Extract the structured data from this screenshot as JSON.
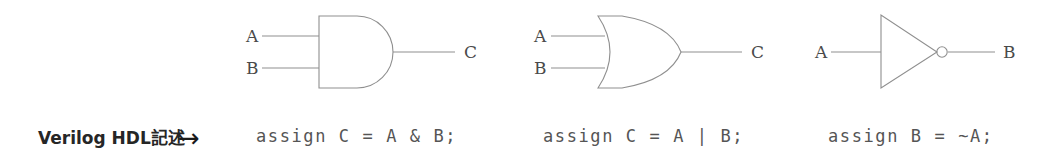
{
  "figure": {
    "background_color": "#ffffff",
    "stroke_color": "#8a8a8a",
    "text_color": "#4a4a4a",
    "caption_color": "#262626"
  },
  "hdl_caption": {
    "label": "Verilog HDL記述",
    "arrow": "→",
    "arrow_name": "right-arrow-icon"
  },
  "gates": [
    {
      "id": "and-gate",
      "type": "AND",
      "gate_symbol_name": "and-gate-symbol",
      "inputs": [
        {
          "label": "A"
        },
        {
          "label": "B"
        }
      ],
      "output": {
        "label": "C"
      },
      "code": "assign C = A & B;"
    },
    {
      "id": "or-gate",
      "type": "OR",
      "gate_symbol_name": "or-gate-symbol",
      "inputs": [
        {
          "label": "A"
        },
        {
          "label": "B"
        }
      ],
      "output": {
        "label": "C"
      },
      "code": "assign C = A | B;"
    },
    {
      "id": "not-gate",
      "type": "NOT",
      "gate_symbol_name": "not-gate-symbol",
      "inputs": [
        {
          "label": "A"
        }
      ],
      "output": {
        "label": "B"
      },
      "code": "assign B = ~A;"
    }
  ]
}
